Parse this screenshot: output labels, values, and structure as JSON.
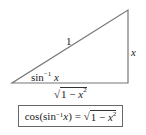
{
  "diagram": {
    "type": "right-triangle",
    "hypotenuse_label": "1",
    "opposite_label": "x",
    "angle_label": {
      "fn": "sin",
      "sup": "−1",
      "var": "x"
    },
    "adjacent_label": {
      "radical": "√",
      "radicand_prefix": "1 − ",
      "var": "x",
      "exp": "2"
    },
    "colors": {
      "line": "#777777",
      "text": "#222222"
    }
  },
  "identity": {
    "lhs_prefix": "cos(sin",
    "lhs_sup": "−1",
    "lhs_var": " x",
    "lhs_close": ")",
    "eq": " = ",
    "radical": "√",
    "radicand_prefix": "1 − ",
    "var": "x",
    "exp": "2"
  }
}
